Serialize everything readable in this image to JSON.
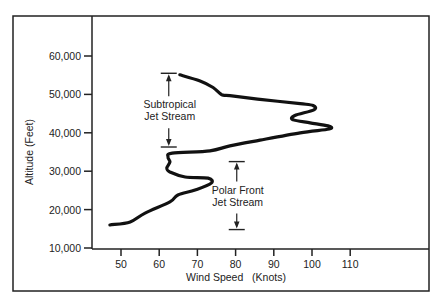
{
  "chart_data": {
    "type": "line",
    "title": "",
    "xlabel": "Wind Speed   (Knots)",
    "ylabel": "Altitude (Feet)",
    "xlim": [
      50,
      110
    ],
    "ylim": [
      10000,
      60000
    ],
    "x_ticks": [
      50,
      60,
      70,
      80,
      90,
      100,
      110
    ],
    "x_tick_labels": [
      "50",
      "60",
      "70",
      "80",
      "90",
      "100",
      "110"
    ],
    "y_ticks": [
      10000,
      20000,
      30000,
      40000,
      50000,
      60000
    ],
    "y_tick_labels": [
      "10,000",
      "20,000",
      "30,000",
      "40,000",
      "50,000",
      "60,000"
    ],
    "grid": false,
    "series": [
      {
        "name": "Wind speed profile",
        "points": [
          [
            47.1,
            16000
          ],
          [
            52.4,
            16800
          ],
          [
            56.3,
            19100
          ],
          [
            62.8,
            22000
          ],
          [
            64.9,
            23800
          ],
          [
            69.4,
            25100
          ],
          [
            73.6,
            26900
          ],
          [
            72.8,
            28200
          ],
          [
            66.8,
            28500
          ],
          [
            62.8,
            29800
          ],
          [
            62.0,
            30800
          ],
          [
            62.8,
            32400
          ],
          [
            62.3,
            33700
          ],
          [
            63.4,
            34700
          ],
          [
            73.3,
            35300
          ],
          [
            78.5,
            36600
          ],
          [
            86.4,
            38100
          ],
          [
            96.9,
            40000
          ],
          [
            104.5,
            41000
          ],
          [
            104.2,
            41800
          ],
          [
            99.5,
            42600
          ],
          [
            95.0,
            43400
          ],
          [
            95.5,
            44500
          ],
          [
            100.5,
            46000
          ],
          [
            100.3,
            47100
          ],
          [
            96.9,
            47600
          ],
          [
            86.4,
            48700
          ],
          [
            78.5,
            49700
          ],
          [
            76.4,
            49900
          ],
          [
            74.1,
            51800
          ],
          [
            70.7,
            53500
          ],
          [
            65.4,
            55100
          ]
        ]
      }
    ],
    "annotations": [
      {
        "name": "subtropical",
        "lines": [
          "Subtropical",
          "Jet Stream"
        ],
        "x": 62.5,
        "range": [
          36300,
          55500
        ]
      },
      {
        "name": "polar-front",
        "lines": [
          "Polar Front",
          "Jet Stream"
        ],
        "x": 80.3,
        "range": [
          14800,
          32500
        ]
      }
    ]
  }
}
